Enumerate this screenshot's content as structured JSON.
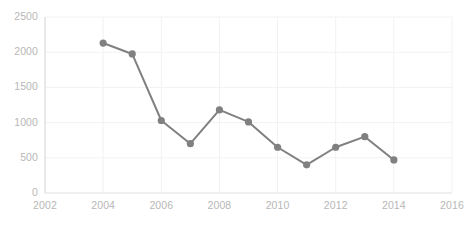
{
  "chart_data": {
    "type": "line",
    "title": "",
    "subtitle": "",
    "xlabel": "",
    "ylabel": "",
    "x": [
      2004,
      2005,
      2006,
      2007,
      2008,
      2009,
      2010,
      2011,
      2012,
      2013,
      2014
    ],
    "values": [
      2130,
      1975,
      1030,
      700,
      1180,
      1010,
      650,
      400,
      650,
      800,
      470
    ],
    "series": [
      {
        "name": "Series 1",
        "values": [
          2130,
          1975,
          1030,
          700,
          1180,
          1010,
          650,
          400,
          650,
          800,
          470
        ]
      }
    ],
    "xlim": [
      2002,
      2016
    ],
    "ylim": [
      0,
      2500
    ],
    "xticks": [
      2002,
      2004,
      2006,
      2008,
      2010,
      2012,
      2014,
      2016
    ],
    "xtick_labels": [
      "2002",
      "2004",
      "2006",
      "2008",
      "2010",
      "2012",
      "2014",
      "2016"
    ],
    "yticks": [
      0,
      500,
      1000,
      1500,
      2000,
      2500
    ],
    "ytick_labels": [
      "0",
      "500",
      "1000",
      "1500",
      "2000",
      "2500"
    ],
    "grid": {
      "horizontal": true,
      "vertical": true,
      "color": "#f2f2f2"
    },
    "legend": {
      "visible": false,
      "position": "none",
      "entries": []
    },
    "annotations": [],
    "style": {
      "line_color": "#808080",
      "marker_color": "#808080",
      "marker_shape": "circle",
      "marker_size": 6,
      "line_width": 2,
      "axis_color": "#e0e0e0",
      "tick_label_color": "#b7b7b7",
      "background": "#ffffff"
    }
  }
}
